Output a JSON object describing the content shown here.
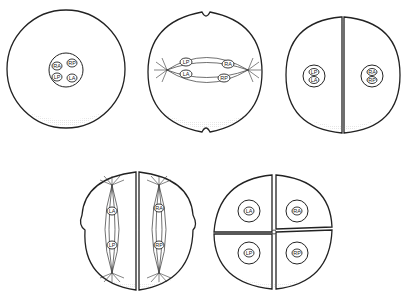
{
  "figure": {
    "title": "",
    "stages": [
      {
        "name": "one-cell",
        "labels": [
          "RA",
          "RP",
          "LP",
          "LA"
        ]
      },
      {
        "name": "first-cleavage-spindle",
        "labels": [
          "LP",
          "RA",
          "LA",
          "RP"
        ]
      },
      {
        "name": "two-cell",
        "left_labels": [
          "LP",
          "LA"
        ],
        "right_labels": [
          "RA",
          "RP"
        ]
      },
      {
        "name": "second-cleavage-spindles",
        "left_labels": [
          "LA",
          "LP"
        ],
        "right_labels": [
          "RA",
          "RP"
        ]
      },
      {
        "name": "four-cell",
        "labels": [
          "LA",
          "RA",
          "LP",
          "RP"
        ]
      }
    ]
  },
  "colors": {
    "line": "#222222",
    "background": "#ffffff",
    "stipple": "#999999"
  }
}
